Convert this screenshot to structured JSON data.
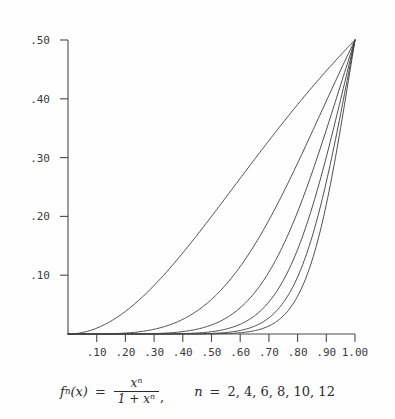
{
  "chart_data": {
    "type": "line",
    "title": "",
    "subtitle": "",
    "xlabel": "",
    "ylabel": "",
    "xlim": [
      0.0,
      1.0
    ],
    "ylim": [
      0.0,
      0.5
    ],
    "grid": false,
    "legend_position": "none",
    "x_tick_labels": [
      ".10",
      ".20",
      ".30",
      ".40",
      ".50",
      ".60",
      ".70",
      ".80",
      ".90",
      "1.00"
    ],
    "x_tick_values": [
      0.1,
      0.2,
      0.3,
      0.4,
      0.5,
      0.6,
      0.7,
      0.8,
      0.9,
      1.0
    ],
    "y_tick_labels": [
      ".10",
      ".20",
      ".30",
      ".40",
      ".50"
    ],
    "y_tick_values": [
      0.1,
      0.2,
      0.3,
      0.4,
      0.5
    ],
    "formula": "f_n(x) = x^n / (1 + x^n)",
    "annotations": [
      "n = 2, 4, 6, 8, 10, 12"
    ],
    "series": [
      {
        "name": "n = 2",
        "n": 2,
        "x": [
          0.0,
          0.05,
          0.1,
          0.15,
          0.2,
          0.25,
          0.3,
          0.35,
          0.4,
          0.45,
          0.5,
          0.55,
          0.6,
          0.65,
          0.7,
          0.75,
          0.8,
          0.85,
          0.9,
          0.95,
          1.0
        ],
        "values": [
          0.0,
          0.0025,
          0.0099,
          0.022,
          0.0385,
          0.0588,
          0.0826,
          0.1094,
          0.1379,
          0.1683,
          0.2,
          0.2322,
          0.2647,
          0.297,
          0.3287,
          0.36,
          0.3902,
          0.4194,
          0.4475,
          0.4744,
          0.5
        ]
      },
      {
        "name": "n = 4",
        "n": 4,
        "x": [
          0.0,
          0.05,
          0.1,
          0.15,
          0.2,
          0.25,
          0.3,
          0.35,
          0.4,
          0.45,
          0.5,
          0.55,
          0.6,
          0.65,
          0.7,
          0.75,
          0.8,
          0.85,
          0.9,
          0.95,
          1.0
        ],
        "values": [
          0.0,
          0.0,
          0.0001,
          0.0005,
          0.0016,
          0.0039,
          0.008,
          0.0148,
          0.025,
          0.0393,
          0.0588,
          0.0838,
          0.1147,
          0.1514,
          0.1935,
          0.2404,
          0.2906,
          0.3428,
          0.3954,
          0.4472,
          0.5
        ]
      },
      {
        "name": "n = 6",
        "n": 6,
        "x": [
          0.0,
          0.05,
          0.1,
          0.15,
          0.2,
          0.25,
          0.3,
          0.35,
          0.4,
          0.45,
          0.5,
          0.55,
          0.6,
          0.65,
          0.7,
          0.75,
          0.8,
          0.85,
          0.9,
          0.95,
          1.0
        ],
        "values": [
          0.0,
          0.0,
          0.0,
          0.0,
          0.0001,
          0.0002,
          0.0007,
          0.0018,
          0.004,
          0.0083,
          0.0154,
          0.027,
          0.0446,
          0.0701,
          0.1052,
          0.1511,
          0.2077,
          0.2737,
          0.3467,
          0.4234,
          0.5
        ]
      },
      {
        "name": "n = 8",
        "n": 8,
        "x": [
          0.0,
          0.05,
          0.1,
          0.15,
          0.2,
          0.25,
          0.3,
          0.35,
          0.4,
          0.45,
          0.5,
          0.55,
          0.6,
          0.65,
          0.7,
          0.75,
          0.8,
          0.85,
          0.9,
          0.95,
          1.0
        ],
        "values": [
          0.0,
          0.0,
          0.0,
          0.0,
          0.0,
          0.0,
          0.0001,
          0.0002,
          0.0007,
          0.0017,
          0.0039,
          0.0082,
          0.0165,
          0.0306,
          0.0543,
          0.0911,
          0.1436,
          0.2118,
          0.2935,
          0.3848,
          0.5
        ]
      },
      {
        "name": "n = 10",
        "n": 10,
        "x": [
          0.0,
          0.05,
          0.1,
          0.15,
          0.2,
          0.25,
          0.3,
          0.35,
          0.4,
          0.45,
          0.5,
          0.55,
          0.6,
          0.65,
          0.7,
          0.75,
          0.8,
          0.85,
          0.9,
          0.95,
          1.0
        ],
        "values": [
          0.0,
          0.0,
          0.0,
          0.0,
          0.0,
          0.0,
          0.0,
          0.0,
          0.0001,
          0.0003,
          0.001,
          0.0025,
          0.006,
          0.0133,
          0.0275,
          0.0533,
          0.097,
          0.1648,
          0.2581,
          0.3682,
          0.5
        ]
      },
      {
        "name": "n = 12",
        "n": 12,
        "x": [
          0.0,
          0.05,
          0.1,
          0.15,
          0.2,
          0.25,
          0.3,
          0.35,
          0.4,
          0.45,
          0.5,
          0.55,
          0.6,
          0.65,
          0.7,
          0.75,
          0.8,
          0.85,
          0.9,
          0.95,
          1.0
        ],
        "values": [
          0.0,
          0.0,
          0.0,
          0.0,
          0.0,
          0.0,
          0.0,
          0.0,
          0.0,
          0.0001,
          0.0002,
          0.0008,
          0.0022,
          0.0056,
          0.0136,
          0.0308,
          0.0649,
          0.1272,
          0.2252,
          0.3511,
          0.5
        ]
      }
    ]
  },
  "caption": {
    "fn": "f",
    "fn_sub": "n",
    "fn_arg": "(x)",
    "equals": "=",
    "numerator_base": "x",
    "numerator_exp": "n",
    "denominator": "1 + x",
    "denominator_exp": "n",
    "comma": ",",
    "n_var": "n",
    "n_equals": "=",
    "n_values": "2, 4, 6, 8, 10, 12"
  },
  "colors": {
    "background": "#fefefe",
    "axis": "#4a4a4a",
    "curve": "#3a3a3a",
    "text": "#2b2b2b"
  }
}
